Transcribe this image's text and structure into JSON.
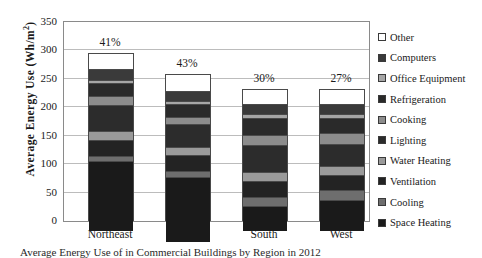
{
  "chart_data": {
    "type": "bar",
    "subtype": "stacked-bar",
    "title": "",
    "xlabel": "",
    "ylabel": "Average Energy Use (Wh/m2)",
    "ylabel_display": "Average Energy Use (Wh/m",
    "ylabel_sup": "2",
    "ylabel_tail": ")",
    "ylim": [
      0,
      350
    ],
    "ytick_step": 50,
    "yticks": [
      "350",
      "300",
      "250",
      "200",
      "150",
      "100",
      "50",
      "0"
    ],
    "grid": true,
    "legend_position": "right",
    "categories": [
      "Northeast",
      "Midwest",
      "South",
      "West"
    ],
    "data_labels": [
      "41%",
      "43%",
      "30%",
      "27%"
    ],
    "totals": [
      295,
      258,
      233,
      232
    ],
    "series": [
      {
        "name": "Space Heating",
        "color": "#1a1a1a",
        "values": [
          121,
          113,
          42,
          53
        ]
      },
      {
        "name": "Cooling",
        "color": "#6e6e6e",
        "values": [
          8,
          9,
          14,
          15
        ]
      },
      {
        "name": "Ventilation",
        "color": "#232323",
        "values": [
          26,
          26,
          27,
          26
        ]
      },
      {
        "name": "Water Heating",
        "color": "#9a9a9a",
        "values": [
          13,
          12,
          13,
          14
        ]
      },
      {
        "name": "Lighting",
        "color": "#2c2c2c",
        "values": [
          44,
          40,
          47,
          36
        ]
      },
      {
        "name": "Cooking",
        "color": "#8c8c8c",
        "values": [
          14,
          10,
          15,
          17
        ]
      },
      {
        "name": "Refrigeration",
        "color": "#2a2a2a",
        "values": [
          22,
          21,
          29,
          26
        ]
      },
      {
        "name": "Office Equipment",
        "color": "#a6a6a6",
        "values": [
          4,
          4,
          5,
          4
        ]
      },
      {
        "name": "Computers",
        "color": "#3a3a3a",
        "values": [
          17,
          16,
          16,
          16
        ]
      },
      {
        "name": "Other",
        "color": "#ffffff",
        "values": [
          26,
          27,
          25,
          25
        ]
      }
    ],
    "legend_entries": [
      {
        "label": "Other",
        "color": "#ffffff"
      },
      {
        "label": "Computers",
        "color": "#3a3a3a"
      },
      {
        "label": "Office Equipment",
        "color": "#a6a6a6"
      },
      {
        "label": "Refrigeration",
        "color": "#2a2a2a"
      },
      {
        "label": "Cooking",
        "color": "#8c8c8c"
      },
      {
        "label": "Lighting",
        "color": "#2c2c2c"
      },
      {
        "label": "Water Heating",
        "color": "#9a9a9a"
      },
      {
        "label": "Ventilation",
        "color": "#232323"
      },
      {
        "label": "Cooling",
        "color": "#6e6e6e"
      },
      {
        "label": "Space Heating",
        "color": "#1a1a1a"
      }
    ]
  },
  "caption": {
    "text": "Average Energy Use of in Commercial Buildings by Region in 2012"
  }
}
